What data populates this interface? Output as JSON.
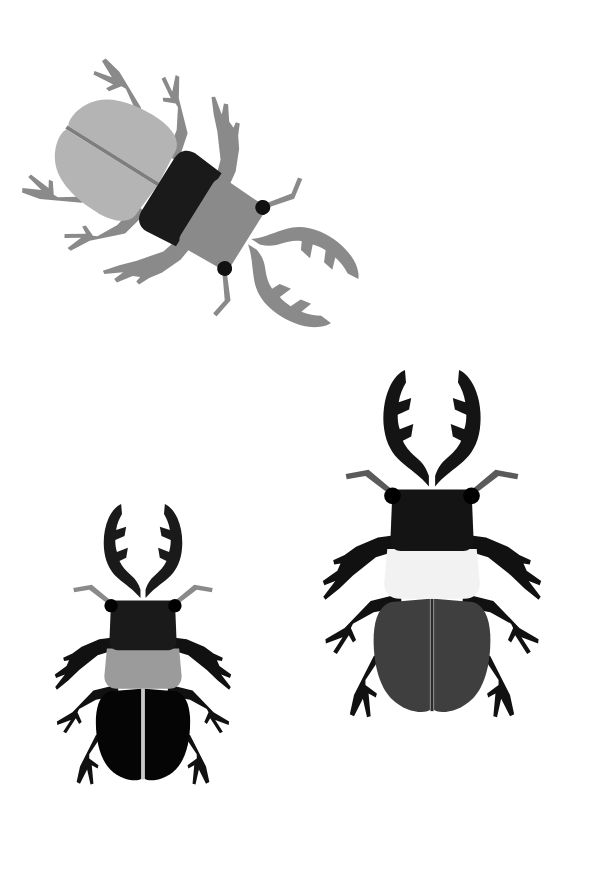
{
  "artwork": {
    "title": "Three Stag Beetles Illustration",
    "subject": "stag-beetle",
    "count": 3,
    "canvas": {
      "width": 589,
      "height": 884,
      "background": "#ffffff"
    }
  },
  "palette": {
    "background": "#ffffff",
    "black": "#111111",
    "near_black": "#1a1a1a",
    "dark_gray": "#3f3f3f",
    "mid_gray": "#8a8a8a",
    "gray": "#9b9b9b",
    "light_gray": "#b4b4b4",
    "pale_gray": "#a9a9a9",
    "off_white": "#f2f2f2",
    "line_gray": "#6f6f6f"
  },
  "beetles": [
    {
      "id": "beetle-top-left",
      "name": "Top rotated beetle",
      "orientation_degrees": 122,
      "position": {
        "x": 175,
        "y": 195
      },
      "scale": 0.95,
      "parts": {
        "mandibles_color": "#8a8a8a",
        "head_color": "#8a8a8a",
        "pronotum_color": "#1a1a1a",
        "elytra_color": "#b4b4b4",
        "legs_color": "#8a8a8a",
        "antennae_color": "#8a8a8a",
        "eye_color": "#111111",
        "suture_color": "#7e7e7e"
      }
    },
    {
      "id": "beetle-bottom-left",
      "name": "Lower left beetle",
      "orientation_degrees": 0,
      "position": {
        "x": 143,
        "y": 672
      },
      "scale": 0.78,
      "parts": {
        "mandibles_color": "#1a1a1a",
        "head_color": "#1a1a1a",
        "pronotum_color": "#9b9b9b",
        "elytra_color": "#050505",
        "legs_color": "#111111",
        "antennae_color": "#8a8a8a",
        "eye_color": "#000000",
        "suture_color": "#c9c9c9"
      }
    },
    {
      "id": "beetle-bottom-right",
      "name": "Lower right beetle",
      "orientation_degrees": 0,
      "position": {
        "x": 432,
        "y": 580
      },
      "scale": 0.95,
      "parts": {
        "mandibles_color": "#141414",
        "head_color": "#141414",
        "pronotum_color": "#f2f2f2",
        "elytra_color": "#3f3f3f",
        "legs_color": "#111111",
        "antennae_color": "#5a5a5a",
        "eye_color": "#000000",
        "suture_color": "#2a2a2a"
      }
    }
  ],
  "anatomy": {
    "labels": [
      "mandible-left",
      "mandible-right",
      "head",
      "eye-left",
      "eye-right",
      "antenna-left",
      "antenna-right",
      "pronotum",
      "elytra-left",
      "elytra-right",
      "elytral-suture",
      "foreleg-left",
      "foreleg-right",
      "midleg-left",
      "midleg-right",
      "hindleg-left",
      "hindleg-right"
    ]
  }
}
